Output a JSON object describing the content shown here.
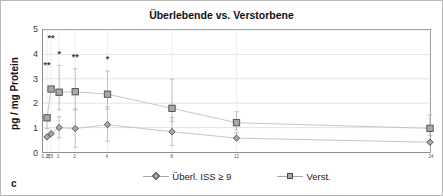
{
  "figure": {
    "panel_label": "c",
    "border_color": "#b9b9b9"
  },
  "chart_data": {
    "type": "line",
    "title": "Überlebende vs. Verstorbene",
    "xlabel": "",
    "ylabel": "pg / mg Protein",
    "x": [
      0.25,
      0.5,
      1,
      2,
      4,
      8,
      12,
      24
    ],
    "x_tick_labels": [
      "0,25",
      "0,5",
      "1",
      "2",
      "4",
      "8",
      "12",
      "24"
    ],
    "y_tick_labels": [
      "0",
      "1",
      "2",
      "3",
      "4",
      "5"
    ],
    "ylim": [
      0,
      5
    ],
    "xlim": [
      0,
      24
    ],
    "grid": "horizontal",
    "legend_position": "bottom",
    "series": [
      {
        "name": "Überl. ISS ≥ 9",
        "marker": "diamond",
        "color": "#a8a8a8",
        "marker_edge": "#4a4a4a",
        "values": [
          0.62,
          0.75,
          1.0,
          0.96,
          1.12,
          0.83,
          0.57,
          0.4
        ],
        "err_low": [
          0.0,
          0.0,
          0.42,
          0.78,
          0.68,
          0.56,
          0.0,
          0.0
        ],
        "err_high": [
          0.0,
          0.0,
          0.45,
          0.8,
          0.72,
          0.58,
          0.22,
          0.0
        ]
      },
      {
        "name": "Verst.",
        "marker": "square",
        "color": "#a8a8a8",
        "marker_edge": "#4a4a4a",
        "values": [
          1.4,
          2.58,
          2.45,
          2.47,
          2.37,
          1.79,
          1.2,
          0.97
        ],
        "err_low": [
          0.45,
          0.0,
          0.72,
          0.75,
          0.62,
          0.55,
          0.3,
          0.3
        ],
        "err_high": [
          0.0,
          0.0,
          1.1,
          0.95,
          0.95,
          1.2,
          0.45,
          0.55
        ]
      }
    ],
    "annotations": [
      {
        "text": "**",
        "x": 0.25,
        "y": 3.45
      },
      {
        "text": "**",
        "x": 0.5,
        "y": 4.55
      },
      {
        "text": "*",
        "x": 1.0,
        "y": 3.9
      },
      {
        "text": "**",
        "x": 2.0,
        "y": 3.78
      },
      {
        "text": "*",
        "x": 4.0,
        "y": 3.68
      }
    ]
  },
  "legend": {
    "entries": [
      {
        "label": "Überl. ISS ≥ 9",
        "marker": "diamond"
      },
      {
        "label": "Verst.",
        "marker": "square"
      }
    ]
  }
}
